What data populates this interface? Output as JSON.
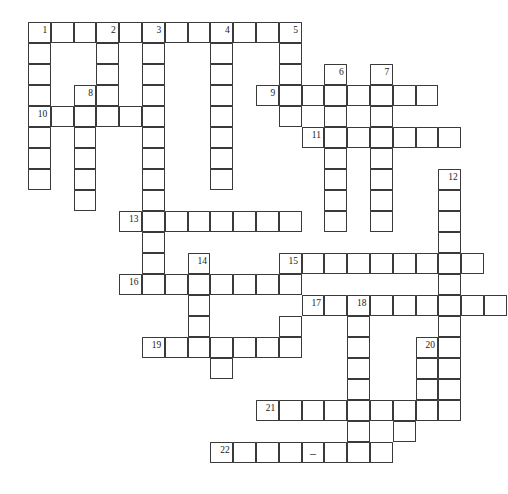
{
  "document": {
    "kind": "crossword-puzzle-grid",
    "title": "Crossword Puzzle Grid",
    "background_color": "#ffffff",
    "cell_border_color": "#3a3a3a",
    "cell_fill_color": "#ffffff",
    "number_color": "#1a1a1a"
  },
  "geometry": {
    "origin_x": 28,
    "origin_y": 22,
    "cell_width": 22.8,
    "cell_height": 21.0,
    "columns": 21,
    "rows": 22
  },
  "entries": [
    {
      "number": "1",
      "direction": "across",
      "row": 0,
      "col": 0,
      "length": 12
    },
    {
      "number": "1",
      "direction": "down",
      "row": 0,
      "col": 0,
      "length": 8
    },
    {
      "number": "2",
      "direction": "down",
      "row": 0,
      "col": 3,
      "length": 3
    },
    {
      "number": "3",
      "direction": "down",
      "row": 0,
      "col": 5,
      "length": 11
    },
    {
      "number": "4",
      "direction": "down",
      "row": 0,
      "col": 8,
      "length": 8
    },
    {
      "number": "5",
      "direction": "down",
      "row": 0,
      "col": 11,
      "length": 5
    },
    {
      "number": "6",
      "direction": "down",
      "row": 2,
      "col": 13,
      "length": 7
    },
    {
      "number": "7",
      "direction": "down",
      "row": 2,
      "col": 15,
      "length": 7
    },
    {
      "number": "8",
      "direction": "down",
      "row": 3,
      "col": 2,
      "length": 7
    },
    {
      "number": "9",
      "direction": "across",
      "row": 3,
      "col": 10,
      "length": 8
    },
    {
      "number": "10",
      "direction": "across",
      "row": 4,
      "col": 0,
      "length": 6
    },
    {
      "number": "11",
      "direction": "across",
      "row": 5,
      "col": 12,
      "length": 7
    },
    {
      "number": "12",
      "direction": "down",
      "row": 7,
      "col": 18,
      "length": 12
    },
    {
      "number": "13",
      "direction": "across",
      "row": 9,
      "col": 4,
      "length": 8
    },
    {
      "number": "14",
      "direction": "down",
      "row": 11,
      "col": 7,
      "length": 5
    },
    {
      "number": "15",
      "direction": "across",
      "row": 11,
      "col": 11,
      "length": 9
    },
    {
      "number": "16",
      "direction": "across",
      "row": 12,
      "col": 4,
      "length": 8
    },
    {
      "number": "17",
      "direction": "across",
      "row": 13,
      "col": 12,
      "length": 9
    },
    {
      "number": "18",
      "direction": "down",
      "row": 13,
      "col": 14,
      "length": 9
    },
    {
      "number": "19",
      "direction": "across",
      "row": 15,
      "col": 5,
      "length": 7
    },
    {
      "number": "20",
      "direction": "down",
      "row": 15,
      "col": 17,
      "length": 5
    },
    {
      "number": "21",
      "direction": "across",
      "row": 18,
      "col": 10,
      "length": 9
    },
    {
      "number": "22",
      "direction": "across",
      "row": 20,
      "col": 8,
      "length": 8
    }
  ],
  "cells": [
    {
      "row": 0,
      "col": 0,
      "number": "1"
    },
    {
      "row": 0,
      "col": 1
    },
    {
      "row": 0,
      "col": 2
    },
    {
      "row": 0,
      "col": 3,
      "number": "2"
    },
    {
      "row": 0,
      "col": 4
    },
    {
      "row": 0,
      "col": 5,
      "number": "3"
    },
    {
      "row": 0,
      "col": 6
    },
    {
      "row": 0,
      "col": 7
    },
    {
      "row": 0,
      "col": 8,
      "number": "4"
    },
    {
      "row": 0,
      "col": 9
    },
    {
      "row": 0,
      "col": 10
    },
    {
      "row": 0,
      "col": 11,
      "number": "5"
    },
    {
      "row": 1,
      "col": 0
    },
    {
      "row": 1,
      "col": 3
    },
    {
      "row": 1,
      "col": 5
    },
    {
      "row": 1,
      "col": 8
    },
    {
      "row": 1,
      "col": 11
    },
    {
      "row": 2,
      "col": 0
    },
    {
      "row": 2,
      "col": 3
    },
    {
      "row": 2,
      "col": 5
    },
    {
      "row": 2,
      "col": 8
    },
    {
      "row": 2,
      "col": 11
    },
    {
      "row": 2,
      "col": 13,
      "number": "6"
    },
    {
      "row": 2,
      "col": 15,
      "number": "7"
    },
    {
      "row": 3,
      "col": 0
    },
    {
      "row": 3,
      "col": 2,
      "number": "8"
    },
    {
      "row": 3,
      "col": 3
    },
    {
      "row": 3,
      "col": 5
    },
    {
      "row": 3,
      "col": 8
    },
    {
      "row": 3,
      "col": 10,
      "number": "9"
    },
    {
      "row": 3,
      "col": 11
    },
    {
      "row": 3,
      "col": 12
    },
    {
      "row": 3,
      "col": 13
    },
    {
      "row": 3,
      "col": 14
    },
    {
      "row": 3,
      "col": 15
    },
    {
      "row": 3,
      "col": 16
    },
    {
      "row": 3,
      "col": 17
    },
    {
      "row": 4,
      "col": 0,
      "number": "10"
    },
    {
      "row": 4,
      "col": 1
    },
    {
      "row": 4,
      "col": 2
    },
    {
      "row": 4,
      "col": 3
    },
    {
      "row": 4,
      "col": 4
    },
    {
      "row": 4,
      "col": 5
    },
    {
      "row": 4,
      "col": 8
    },
    {
      "row": 4,
      "col": 11
    },
    {
      "row": 4,
      "col": 13
    },
    {
      "row": 4,
      "col": 15
    },
    {
      "row": 5,
      "col": 0
    },
    {
      "row": 5,
      "col": 2
    },
    {
      "row": 5,
      "col": 5
    },
    {
      "row": 5,
      "col": 8
    },
    {
      "row": 5,
      "col": 12,
      "number": "11"
    },
    {
      "row": 5,
      "col": 13
    },
    {
      "row": 5,
      "col": 14
    },
    {
      "row": 5,
      "col": 15
    },
    {
      "row": 5,
      "col": 16
    },
    {
      "row": 5,
      "col": 17
    },
    {
      "row": 5,
      "col": 18
    },
    {
      "row": 6,
      "col": 0
    },
    {
      "row": 6,
      "col": 2
    },
    {
      "row": 6,
      "col": 5
    },
    {
      "row": 6,
      "col": 8
    },
    {
      "row": 6,
      "col": 13
    },
    {
      "row": 6,
      "col": 15
    },
    {
      "row": 7,
      "col": 0
    },
    {
      "row": 7,
      "col": 2
    },
    {
      "row": 7,
      "col": 5
    },
    {
      "row": 7,
      "col": 8
    },
    {
      "row": 7,
      "col": 13
    },
    {
      "row": 7,
      "col": 15
    },
    {
      "row": 7,
      "col": 18,
      "number": "12"
    },
    {
      "row": 8,
      "col": 2
    },
    {
      "row": 8,
      "col": 5
    },
    {
      "row": 8,
      "col": 13
    },
    {
      "row": 8,
      "col": 15
    },
    {
      "row": 8,
      "col": 18
    },
    {
      "row": 9,
      "col": 4,
      "number": "13"
    },
    {
      "row": 9,
      "col": 5
    },
    {
      "row": 9,
      "col": 6
    },
    {
      "row": 9,
      "col": 7
    },
    {
      "row": 9,
      "col": 8
    },
    {
      "row": 9,
      "col": 9
    },
    {
      "row": 9,
      "col": 10
    },
    {
      "row": 9,
      "col": 11
    },
    {
      "row": 9,
      "col": 13
    },
    {
      "row": 9,
      "col": 15
    },
    {
      "row": 9,
      "col": 18
    },
    {
      "row": 10,
      "col": 5
    },
    {
      "row": 10,
      "col": 18
    },
    {
      "row": 11,
      "col": 5
    },
    {
      "row": 11,
      "col": 7,
      "number": "14"
    },
    {
      "row": 11,
      "col": 11,
      "number": "15"
    },
    {
      "row": 11,
      "col": 12
    },
    {
      "row": 11,
      "col": 13
    },
    {
      "row": 11,
      "col": 14
    },
    {
      "row": 11,
      "col": 15
    },
    {
      "row": 11,
      "col": 16
    },
    {
      "row": 11,
      "col": 17
    },
    {
      "row": 11,
      "col": 18
    },
    {
      "row": 11,
      "col": 19
    },
    {
      "row": 12,
      "col": 4,
      "number": "16"
    },
    {
      "row": 12,
      "col": 5
    },
    {
      "row": 12,
      "col": 6
    },
    {
      "row": 12,
      "col": 7
    },
    {
      "row": 12,
      "col": 8
    },
    {
      "row": 12,
      "col": 9
    },
    {
      "row": 12,
      "col": 10
    },
    {
      "row": 12,
      "col": 11
    },
    {
      "row": 12,
      "col": 18
    },
    {
      "row": 13,
      "col": 7
    },
    {
      "row": 13,
      "col": 12,
      "number": "17"
    },
    {
      "row": 13,
      "col": 13
    },
    {
      "row": 13,
      "col": 14,
      "number": "18"
    },
    {
      "row": 13,
      "col": 15
    },
    {
      "row": 13,
      "col": 16
    },
    {
      "row": 13,
      "col": 17
    },
    {
      "row": 13,
      "col": 18
    },
    {
      "row": 13,
      "col": 19
    },
    {
      "row": 13,
      "col": 20
    },
    {
      "row": 14,
      "col": 7
    },
    {
      "row": 14,
      "col": 11
    },
    {
      "row": 14,
      "col": 14
    },
    {
      "row": 14,
      "col": 18
    },
    {
      "row": 15,
      "col": 5,
      "number": "19"
    },
    {
      "row": 15,
      "col": 6
    },
    {
      "row": 15,
      "col": 7
    },
    {
      "row": 15,
      "col": 8
    },
    {
      "row": 15,
      "col": 9
    },
    {
      "row": 15,
      "col": 10
    },
    {
      "row": 15,
      "col": 11
    },
    {
      "row": 15,
      "col": 14
    },
    {
      "row": 15,
      "col": 17,
      "number": "20"
    },
    {
      "row": 15,
      "col": 18
    },
    {
      "row": 16,
      "col": 8
    },
    {
      "row": 16,
      "col": 14
    },
    {
      "row": 16,
      "col": 17
    },
    {
      "row": 16,
      "col": 18
    },
    {
      "row": 17,
      "col": 14
    },
    {
      "row": 17,
      "col": 17
    },
    {
      "row": 17,
      "col": 18
    },
    {
      "row": 18,
      "col": 10,
      "number": "21"
    },
    {
      "row": 18,
      "col": 11
    },
    {
      "row": 18,
      "col": 12
    },
    {
      "row": 18,
      "col": 13
    },
    {
      "row": 18,
      "col": 14
    },
    {
      "row": 18,
      "col": 15
    },
    {
      "row": 18,
      "col": 16
    },
    {
      "row": 18,
      "col": 17
    },
    {
      "row": 18,
      "col": 18
    },
    {
      "row": 19,
      "col": 14
    },
    {
      "row": 19,
      "col": 16
    },
    {
      "row": 20,
      "col": 8,
      "number": "22"
    },
    {
      "row": 20,
      "col": 9
    },
    {
      "row": 20,
      "col": 10
    },
    {
      "row": 20,
      "col": 11
    },
    {
      "row": 20,
      "col": 12,
      "glyph": "–"
    },
    {
      "row": 20,
      "col": 13
    },
    {
      "row": 20,
      "col": 14
    },
    {
      "row": 20,
      "col": 15
    }
  ]
}
